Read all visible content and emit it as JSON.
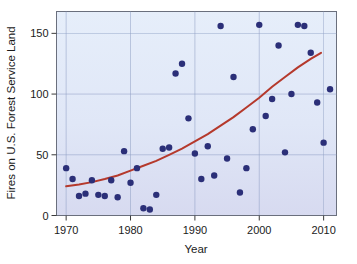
{
  "chart_data": {
    "type": "scatter",
    "title": "",
    "xlabel": "Year",
    "ylabel": "Fires on U.S. Forest Service Land",
    "xlim": [
      1968.5,
      2012.0
    ],
    "ylim": [
      0,
      168
    ],
    "xticks": [
      1970,
      1980,
      1990,
      2000,
      2010
    ],
    "yticks": [
      0,
      50,
      100,
      150
    ],
    "xtick_labels": [
      "1970",
      "1980",
      "1990",
      "2000",
      "2010"
    ],
    "ytick_labels": [
      "0",
      "50",
      "100",
      "150"
    ],
    "grid": true,
    "grid_color": "#8f9fc4",
    "legend": "none",
    "plot_background_top": "#e4ecf9",
    "plot_background_bottom": "#d9dcf1",
    "point_color": "#2b2f78",
    "point_size": 3.2,
    "series": [
      {
        "name": "Fires on U.S. Forest Service Land",
        "marker": "circle",
        "points": [
          {
            "x": 1970,
            "y": 39
          },
          {
            "x": 1971,
            "y": 30
          },
          {
            "x": 1972,
            "y": 16
          },
          {
            "x": 1973,
            "y": 18
          },
          {
            "x": 1974,
            "y": 29
          },
          {
            "x": 1975,
            "y": 17
          },
          {
            "x": 1976,
            "y": 16
          },
          {
            "x": 1977,
            "y": 29
          },
          {
            "x": 1978,
            "y": 15
          },
          {
            "x": 1979,
            "y": 53
          },
          {
            "x": 1980,
            "y": 27
          },
          {
            "x": 1981,
            "y": 39
          },
          {
            "x": 1982,
            "y": 6
          },
          {
            "x": 1983,
            "y": 5
          },
          {
            "x": 1984,
            "y": 17
          },
          {
            "x": 1985,
            "y": 55
          },
          {
            "x": 1986,
            "y": 56
          },
          {
            "x": 1987,
            "y": 117
          },
          {
            "x": 1988,
            "y": 125
          },
          {
            "x": 1989,
            "y": 80
          },
          {
            "x": 1990,
            "y": 51
          },
          {
            "x": 1991,
            "y": 30
          },
          {
            "x": 1992,
            "y": 57
          },
          {
            "x": 1993,
            "y": 33
          },
          {
            "x": 1994,
            "y": 156
          },
          {
            "x": 1995,
            "y": 47
          },
          {
            "x": 1996,
            "y": 114
          },
          {
            "x": 1997,
            "y": 19
          },
          {
            "x": 1998,
            "y": 39
          },
          {
            "x": 1999,
            "y": 71
          },
          {
            "x": 2000,
            "y": 157
          },
          {
            "x": 2001,
            "y": 82
          },
          {
            "x": 2002,
            "y": 96
          },
          {
            "x": 2003,
            "y": 140
          },
          {
            "x": 2004,
            "y": 52
          },
          {
            "x": 2005,
            "y": 100
          },
          {
            "x": 2006,
            "y": 157
          },
          {
            "x": 2007,
            "y": 156
          },
          {
            "x": 2008,
            "y": 134
          },
          {
            "x": 2009,
            "y": 93
          },
          {
            "x": 2010,
            "y": 60
          },
          {
            "x": 2011,
            "y": 104
          }
        ]
      }
    ],
    "trend": {
      "name": "exponential fit",
      "color": "#b5392c",
      "width": 2.0,
      "points": [
        {
          "x": 1970,
          "y": 24
        },
        {
          "x": 1972,
          "y": 25.5
        },
        {
          "x": 1974,
          "y": 27.5
        },
        {
          "x": 1976,
          "y": 30
        },
        {
          "x": 1978,
          "y": 33
        },
        {
          "x": 1980,
          "y": 37
        },
        {
          "x": 1982,
          "y": 41
        },
        {
          "x": 1984,
          "y": 45
        },
        {
          "x": 1986,
          "y": 50
        },
        {
          "x": 1988,
          "y": 55
        },
        {
          "x": 1990,
          "y": 61
        },
        {
          "x": 1992,
          "y": 67
        },
        {
          "x": 1994,
          "y": 74
        },
        {
          "x": 1996,
          "y": 81
        },
        {
          "x": 1998,
          "y": 89
        },
        {
          "x": 2000,
          "y": 97
        },
        {
          "x": 2002,
          "y": 106
        },
        {
          "x": 2004,
          "y": 114
        },
        {
          "x": 2006,
          "y": 122
        },
        {
          "x": 2008,
          "y": 129
        },
        {
          "x": 2009.6,
          "y": 134
        }
      ]
    }
  }
}
